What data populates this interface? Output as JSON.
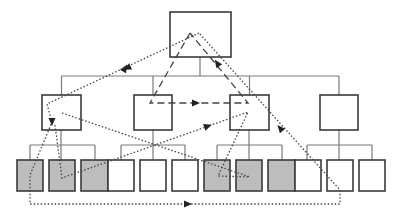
{
  "diagram": {
    "type": "tree-hierarchy-with-traversal-paths",
    "colors": {
      "box_stroke": "#3a3a3a",
      "connector": "#7a7a7a",
      "shaded_fill": "#bdbdbd",
      "empty_fill": "#ffffff",
      "path_stroke": "#444444"
    },
    "root": {
      "x": 170,
      "y": 12,
      "w": 61,
      "h": 45
    },
    "root_bus": {
      "y": 76,
      "x1": 61,
      "x2": 339,
      "stem_x": 200
    },
    "level2": [
      {
        "id": "n1",
        "x": 42,
        "y": 95,
        "w": 39,
        "h": 35
      },
      {
        "id": "n2",
        "x": 134,
        "y": 95,
        "w": 38,
        "h": 35
      },
      {
        "id": "n3",
        "x": 230,
        "y": 95,
        "w": 39,
        "h": 35
      },
      {
        "id": "n4",
        "x": 320,
        "y": 95,
        "w": 38,
        "h": 35
      }
    ],
    "level2_buses": [
      {
        "y": 145,
        "x1": 30,
        "x2": 95,
        "stem_x": 61
      },
      {
        "y": 145,
        "x1": 121,
        "x2": 185,
        "stem_x": 153
      },
      {
        "y": 145,
        "x1": 217,
        "x2": 282,
        "stem_x": 249
      },
      {
        "y": 145,
        "x1": 307,
        "x2": 372,
        "stem_x": 339
      }
    ],
    "leaves": [
      {
        "x": 17,
        "shaded": true
      },
      {
        "x": 49,
        "shaded": true
      },
      {
        "x": 81,
        "shaded": true
      },
      {
        "x": 108,
        "shaded": false
      },
      {
        "x": 140,
        "shaded": false
      },
      {
        "x": 172,
        "shaded": false
      },
      {
        "x": 204,
        "shaded": true
      },
      {
        "x": 236,
        "shaded": true
      },
      {
        "x": 268,
        "shaded": true
      },
      {
        "x": 295,
        "shaded": false
      },
      {
        "x": 327,
        "shaded": false
      },
      {
        "x": 359,
        "shaded": false
      }
    ],
    "leaf_size": {
      "y": 160,
      "w": 26,
      "h": 31
    },
    "leaf_stems_x": [
      30,
      95,
      121,
      185,
      217,
      282,
      307,
      372
    ],
    "paths": [
      {
        "name": "dashed-triangle",
        "style": "dashed",
        "points": [
          [
            190,
            33
          ],
          [
            150,
            103
          ],
          [
            248,
            103
          ],
          [
            190,
            33
          ]
        ],
        "arrows": [
          [
            125,
            68,
            -60
          ],
          [
            196,
            103,
            0
          ],
          [
            217,
            63,
            -125
          ]
        ]
      },
      {
        "name": "dotted-outer-loop",
        "style": "dotted",
        "points": [
          [
            199,
            33
          ],
          [
            47,
            104
          ],
          [
            52,
            122
          ],
          [
            30,
            175
          ],
          [
            30,
            204
          ],
          [
            340,
            204
          ],
          [
            340,
            190
          ],
          [
            199,
            33
          ]
        ],
        "arrows": [
          [
            127,
            68,
            155
          ],
          [
            52,
            122,
            90
          ],
          [
            188,
            204,
            0
          ],
          [
            280,
            128,
            -130
          ]
        ]
      },
      {
        "name": "dotted-cross-a",
        "style": "dotted",
        "points": [
          [
            62,
            113
          ],
          [
            250,
            177
          ]
        ],
        "arrows": []
      },
      {
        "name": "dotted-cross-b",
        "style": "dotted",
        "points": [
          [
            55,
            125
          ],
          [
            62,
            178
          ],
          [
            248,
            112
          ],
          [
            218,
            176
          ],
          [
            250,
            177
          ]
        ],
        "arrows": [
          [
            208,
            126,
            -20
          ]
        ]
      }
    ]
  }
}
